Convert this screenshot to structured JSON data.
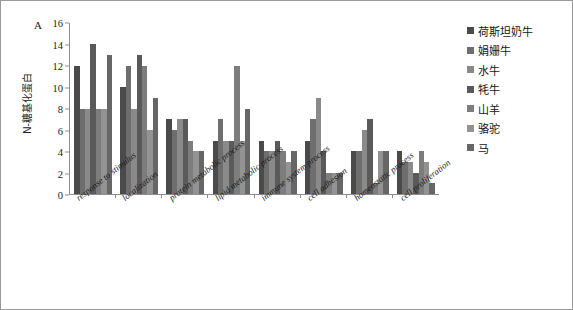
{
  "figure": {
    "panel_letter": "A",
    "y_axis_title": "N-糖基化蛋白"
  },
  "legend": {
    "position": "right",
    "items": [
      {
        "label": "荷斯坦奶牛",
        "color": "#4a4a4a"
      },
      {
        "label": "娟姗牛",
        "color": "#6e6e6e"
      },
      {
        "label": "水牛",
        "color": "#8a8a8a"
      },
      {
        "label": "牦牛",
        "color": "#5a5a5a"
      },
      {
        "label": "山羊",
        "color": "#7d7d7d"
      },
      {
        "label": "骆驼",
        "color": "#939393"
      },
      {
        "label": "马",
        "color": "#666666"
      }
    ]
  },
  "chart_data": {
    "type": "bar",
    "title": "",
    "xlabel": "",
    "ylabel": "N-糖基化蛋白",
    "ylim": [
      0,
      16
    ],
    "yticks": [
      0,
      2,
      4,
      6,
      8,
      10,
      12,
      14,
      16
    ],
    "grid": false,
    "legend_position": "right",
    "categories": [
      "response to stimulus",
      "localization",
      "protein metabolic process",
      "lipid metabolic process",
      "immune system process",
      "cell adhesion",
      "homeostatic process",
      "cell proliferation"
    ],
    "series": [
      {
        "name": "荷斯坦奶牛",
        "color": "#4a4a4a",
        "values": [
          12,
          10,
          7,
          5,
          5,
          5,
          4,
          4
        ]
      },
      {
        "name": "娟姗牛",
        "color": "#6e6e6e",
        "values": [
          8,
          12,
          6,
          7,
          4,
          7,
          4,
          3
        ]
      },
      {
        "name": "水牛",
        "color": "#8a8a8a",
        "values": [
          8,
          8,
          7,
          5,
          4,
          9,
          6,
          3
        ]
      },
      {
        "name": "牦牛",
        "color": "#5a5a5a",
        "values": [
          14,
          13,
          7,
          5,
          5,
          4,
          7,
          2
        ]
      },
      {
        "name": "山羊",
        "color": "#7d7d7d",
        "values": [
          8,
          12,
          5,
          12,
          4,
          2,
          1,
          4
        ]
      },
      {
        "name": "骆驼",
        "color": "#939393",
        "values": [
          8,
          6,
          4,
          5,
          3,
          2,
          4,
          3
        ]
      },
      {
        "name": "马",
        "color": "#666666",
        "values": [
          13,
          9,
          4,
          8,
          4,
          2,
          4,
          1
        ]
      }
    ]
  }
}
